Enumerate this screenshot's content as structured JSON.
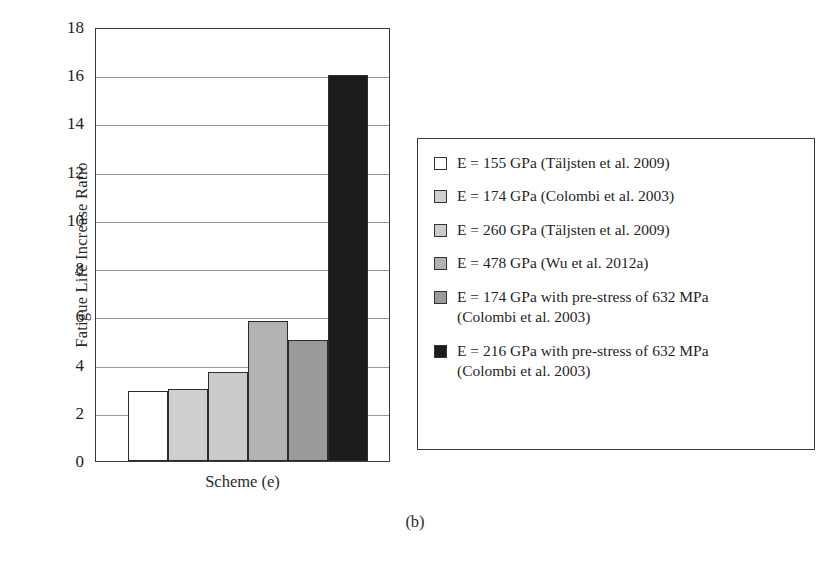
{
  "chart_data": {
    "type": "bar",
    "title": "",
    "subtitle": "",
    "xlabel": "Scheme (e)",
    "ylabel": "Fatigue Life Increase Ratio",
    "categories": [
      "E = 155 GPa (Täljsten et al. 2009)",
      "E = 174 GPa (Colombi et al. 2003)",
      "E = 260 GPa (Täljsten et al. 2009)",
      "E = 478 GPa (Wu et al. 2012a)",
      "E = 174 GPa with pre-stress of 632 MPa (Colombi et al. 2003)",
      "E = 216 GPa with pre-stress of 632 MPa (Colombi et al. 2003)"
    ],
    "values": [
      2.9,
      3.0,
      3.7,
      5.8,
      5.0,
      16.0
    ],
    "colors": [
      "#ffffff",
      "#cfcfcf",
      "#cbcbcb",
      "#b2b2b2",
      "#9a9a9a",
      "#1c1c1c"
    ],
    "ylim": [
      0,
      18
    ],
    "ytick_step": 2,
    "yticks": [
      18,
      16,
      14,
      12,
      10,
      8,
      6,
      4,
      2,
      0
    ],
    "grid": true,
    "legend_position": "right",
    "caption": "(b)"
  },
  "axis": {
    "y_title": "Fatigue Life Increase Ratio",
    "x_category": "Scheme (e)",
    "tick_labels": [
      "18",
      "16",
      "14",
      "12",
      "10",
      "8",
      "6",
      "4",
      "2",
      "0"
    ]
  },
  "legend": {
    "items": [
      {
        "label": "E = 155 GPa (Täljsten et al. 2009)",
        "color": "#ffffff"
      },
      {
        "label": "E = 174 GPa (Colombi et al. 2003)",
        "color": "#cfcfcf"
      },
      {
        "label": "E = 260 GPa (Täljsten et al. 2009)",
        "color": "#cbcbcb"
      },
      {
        "label": "E = 478 GPa (Wu et al. 2012a)",
        "color": "#b2b2b2"
      },
      {
        "label": "E = 174 GPa with pre-stress of 632 MPa\n(Colombi et al. 2003)",
        "color": "#9a9a9a"
      },
      {
        "label": "E = 216 GPa with pre-stress of 632 MPa\n(Colombi et al. 2003)",
        "color": "#1c1c1c"
      }
    ]
  },
  "caption": {
    "text": "(b)"
  }
}
